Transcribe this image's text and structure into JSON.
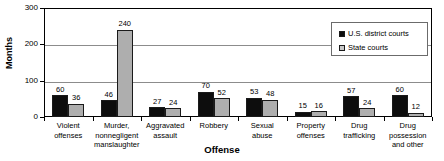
{
  "chart_data": {
    "type": "bar",
    "title": "",
    "xlabel": "Offense",
    "ylabel": "Months",
    "ylim": [
      0,
      300
    ],
    "yticks": [
      "0",
      "100",
      "200",
      "300"
    ],
    "grid": true,
    "legend_position": "top-right",
    "categories": [
      "Violent offenses",
      "Murder, nonnegligent manslaughter",
      "Aggravated assault",
      "Robbery",
      "Sexual abuse",
      "Property offenses",
      "Drug trafficking",
      "Drug possession and other"
    ],
    "category_lines": [
      [
        "Violent",
        "offenses"
      ],
      [
        "Murder,",
        "nonnegligent",
        "manslaughter"
      ],
      [
        "Aggravated",
        "assault"
      ],
      [
        "Robbery"
      ],
      [
        "Sexual",
        "abuse"
      ],
      [
        "Property",
        "offenses"
      ],
      [
        "Drug",
        "trafficking"
      ],
      [
        "Drug",
        "possession",
        "and other"
      ]
    ],
    "series": [
      {
        "name": "U.S. district courts",
        "color": "#0d0d0d",
        "values": [
          60,
          46,
          27,
          70,
          53,
          15,
          57,
          60
        ]
      },
      {
        "name": "State courts",
        "color": "#aeaeae",
        "values": [
          36,
          240,
          24,
          52,
          48,
          16,
          24,
          12
        ]
      }
    ]
  },
  "legend": {
    "items": [
      {
        "label": "U.S. district courts",
        "swatch": "federal"
      },
      {
        "label": "State courts",
        "swatch": "state"
      }
    ]
  },
  "axes": {
    "y_title": "Months",
    "x_title": "Offense"
  }
}
